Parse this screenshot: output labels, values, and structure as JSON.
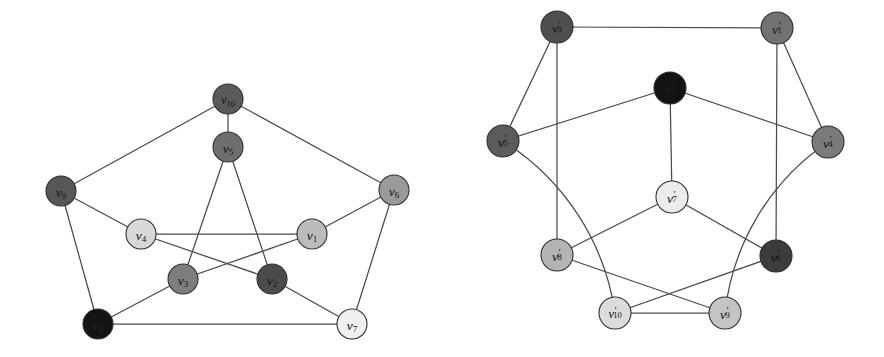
{
  "figure": {
    "background_color": "#ffffff",
    "edge_color": "#4a4a4a",
    "node_stroke_color": "#2e2e2e",
    "panels": [
      {
        "id": "left-graph",
        "name": "graph-g",
        "node_radius": 15,
        "nodes": [
          {
            "id": "v10",
            "base": "v",
            "sub": "10",
            "label": "v10",
            "x": 228,
            "y": 99,
            "fill": "#5a5a5a",
            "text_color": "#141414"
          },
          {
            "id": "v5",
            "base": "v",
            "sub": "5",
            "label": "v5",
            "x": 228,
            "y": 147,
            "fill": "#6e6e6e",
            "text_color": "#141414"
          },
          {
            "id": "v9",
            "base": "v",
            "sub": "9",
            "label": "v9",
            "x": 61,
            "y": 191,
            "fill": "#575757",
            "text_color": "#141414"
          },
          {
            "id": "v6",
            "base": "v",
            "sub": "6",
            "label": "v6",
            "x": 394,
            "y": 190,
            "fill": "#9a9a9a",
            "text_color": "#141414"
          },
          {
            "id": "v4",
            "base": "v",
            "sub": "4",
            "label": "v4",
            "x": 141,
            "y": 234,
            "fill": "#d8d8d8",
            "text_color": "#141414"
          },
          {
            "id": "v1",
            "base": "v",
            "sub": "1",
            "label": "v1",
            "x": 312,
            "y": 234,
            "fill": "#bcbcbc",
            "text_color": "#141414"
          },
          {
            "id": "v3",
            "base": "v",
            "sub": "3",
            "label": "v3",
            "x": 183,
            "y": 279,
            "fill": "#7d7d7d",
            "text_color": "#141414"
          },
          {
            "id": "v2",
            "base": "v",
            "sub": "2",
            "label": "v2",
            "x": 272,
            "y": 279,
            "fill": "#4b4b4b",
            "text_color": "#111111"
          },
          {
            "id": "v8",
            "base": "v",
            "sub": "8",
            "label": "v8",
            "x": 98,
            "y": 324,
            "fill": "#141414",
            "text_color": "#2a2a2a"
          },
          {
            "id": "v7",
            "base": "v",
            "sub": "7",
            "label": "v7",
            "x": 352,
            "y": 324,
            "fill": "#f0f0f0",
            "text_color": "#141414"
          }
        ],
        "edges": [
          {
            "from": "v10",
            "to": "v9"
          },
          {
            "from": "v10",
            "to": "v6"
          },
          {
            "from": "v10",
            "to": "v5"
          },
          {
            "from": "v9",
            "to": "v8"
          },
          {
            "from": "v9",
            "to": "v4"
          },
          {
            "from": "v6",
            "to": "v7"
          },
          {
            "from": "v6",
            "to": "v1"
          },
          {
            "from": "v8",
            "to": "v7"
          },
          {
            "from": "v8",
            "to": "v3"
          },
          {
            "from": "v7",
            "to": "v2"
          },
          {
            "from": "v5",
            "to": "v3"
          },
          {
            "from": "v5",
            "to": "v2"
          },
          {
            "from": "v4",
            "to": "v1"
          },
          {
            "from": "v4",
            "to": "v2"
          },
          {
            "from": "v3",
            "to": "v1"
          }
        ]
      },
      {
        "id": "right-graph",
        "name": "graph-g-prime",
        "node_radius": 16,
        "nodes": [
          {
            "id": "v3p",
            "base": "v",
            "sub": "3",
            "prime": true,
            "label": "v'3",
            "x": 557,
            "y": 27,
            "fill": "#4f4f4f",
            "text_color": "#121212"
          },
          {
            "id": "v1p",
            "base": "v",
            "sub": "1",
            "prime": true,
            "label": "v'1",
            "x": 777,
            "y": 28,
            "fill": "#727272",
            "text_color": "#121212"
          },
          {
            "id": "v2p",
            "base": "v",
            "sub": "2",
            "prime": true,
            "label": "v'2",
            "x": 670,
            "y": 88,
            "fill": "#121212",
            "text_color": "#262626"
          },
          {
            "id": "v5p",
            "base": "v",
            "sub": "5",
            "prime": true,
            "label": "v'5",
            "x": 503,
            "y": 141,
            "fill": "#5c5c5c",
            "text_color": "#121212"
          },
          {
            "id": "v4p",
            "base": "v",
            "sub": "4",
            "prime": true,
            "label": "v'4",
            "x": 828,
            "y": 142,
            "fill": "#7b7b7b",
            "text_color": "#121212"
          },
          {
            "id": "v7p",
            "base": "v",
            "sub": "7",
            "prime": true,
            "label": "v'7",
            "x": 672,
            "y": 197,
            "fill": "#ececec",
            "text_color": "#121212"
          },
          {
            "id": "v8p",
            "base": "v",
            "sub": "8",
            "prime": true,
            "label": "v'8",
            "x": 557,
            "y": 255,
            "fill": "#b4b4b4",
            "text_color": "#121212"
          },
          {
            "id": "v6p",
            "base": "v",
            "sub": "6",
            "prime": true,
            "label": "v'6",
            "x": 776,
            "y": 256,
            "fill": "#3c3c3c",
            "text_color": "#111111"
          },
          {
            "id": "v10p",
            "base": "v",
            "sub": "10",
            "prime": true,
            "label": "v'10",
            "x": 615,
            "y": 313,
            "fill": "#dcdcdc",
            "text_color": "#121212"
          },
          {
            "id": "v9p",
            "base": "v",
            "sub": "9",
            "prime": true,
            "label": "v'9",
            "x": 725,
            "y": 313,
            "fill": "#c4c4c4",
            "text_color": "#121212"
          }
        ],
        "edges": [
          {
            "from": "v3p",
            "to": "v1p",
            "curved": false
          },
          {
            "from": "v3p",
            "to": "v5p",
            "curved": false
          },
          {
            "from": "v3p",
            "to": "v8p",
            "curved": false
          },
          {
            "from": "v1p",
            "to": "v4p",
            "curved": false
          },
          {
            "from": "v1p",
            "to": "v6p",
            "curved": false
          },
          {
            "from": "v2p",
            "to": "v5p",
            "curved": false
          },
          {
            "from": "v2p",
            "to": "v4p",
            "curved": false
          },
          {
            "from": "v2p",
            "to": "v7p",
            "curved": false
          },
          {
            "from": "v7p",
            "to": "v8p",
            "curved": false
          },
          {
            "from": "v7p",
            "to": "v6p",
            "curved": false
          },
          {
            "from": "v8p",
            "to": "v9p",
            "curved": false
          },
          {
            "from": "v6p",
            "to": "v10p",
            "curved": false
          },
          {
            "from": "v10p",
            "to": "v9p",
            "curved": false
          },
          {
            "from": "v5p",
            "to": "v10p",
            "curved": true,
            "sweep": 1,
            "bulge": 0.42
          },
          {
            "from": "v4p",
            "to": "v9p",
            "curved": true,
            "sweep": 0,
            "bulge": 0.42
          }
        ]
      }
    ]
  }
}
